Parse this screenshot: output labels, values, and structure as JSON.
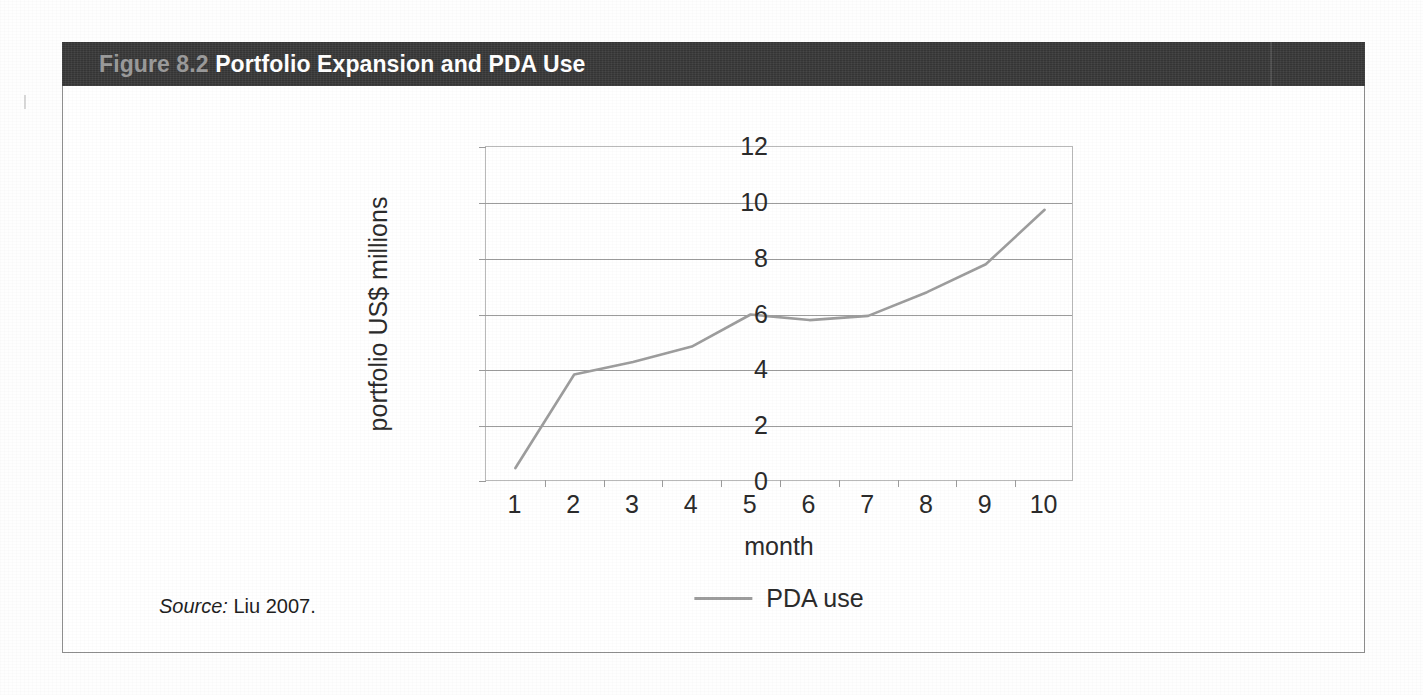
{
  "figure": {
    "number": "Figure 8.2",
    "title": "Portfolio Expansion and PDA Use"
  },
  "source": {
    "label": "Source:",
    "value": "Liu 2007."
  },
  "colors": {
    "header_bar": "#3a3a3a",
    "figure_number": "#9a9a9a",
    "figure_title": "#ffffff",
    "series_line": "#9d9d9d",
    "gridline": "#9c9c9c",
    "plot_border": "#b9b9b9",
    "text": "#2b2b2b"
  },
  "chart_data": {
    "type": "line",
    "title": "Portfolio Expansion and PDA Use",
    "xlabel": "month",
    "ylabel": "portfolio US$ millions",
    "categories": [
      "1",
      "2",
      "3",
      "4",
      "5",
      "6",
      "7",
      "8",
      "9",
      "10"
    ],
    "yticks": [
      "12",
      "10",
      "8",
      "6",
      "4",
      "2",
      "0"
    ],
    "ylim": [
      0,
      12
    ],
    "grid": "horizontal",
    "legend_position": "bottom",
    "series": [
      {
        "name": "PDA use",
        "values": [
          0.5,
          3.85,
          4.3,
          4.85,
          6.0,
          5.8,
          5.95,
          6.8,
          7.8,
          9.75
        ]
      }
    ]
  }
}
